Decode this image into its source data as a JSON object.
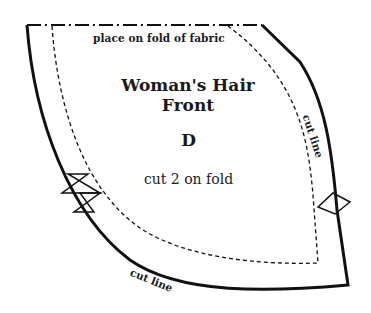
{
  "pattern": {
    "fold_instruction": "place on fold of fabric",
    "title_line1": "Woman's Hair",
    "title_line2": "Front",
    "piece_letter": "D",
    "cut_instruction": "cut 2 on fold",
    "cut_line_right": "cut line",
    "cut_line_bottom": "cut line",
    "colors": {
      "line": "#111111",
      "background": "#ffffff"
    },
    "markings": {
      "fold_line": "dash-dot",
      "seam_line": "dashed",
      "cut_line": "solid",
      "notches": [
        "double-triangle-notch-left",
        "single-diamond-notch-right"
      ]
    }
  }
}
